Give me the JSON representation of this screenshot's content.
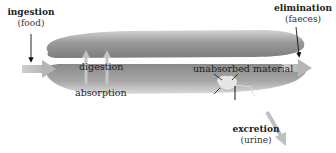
{
  "diagram": {
    "title": "",
    "labels": {
      "ingestion": {
        "title": "ingestion",
        "sub": "(food)"
      },
      "elimination": {
        "title": "elimination",
        "sub": "(faeces)"
      },
      "excretion": {
        "title": "excretion",
        "sub": "(urine)"
      },
      "digestion": "digestion",
      "absorption": "absorption",
      "unabsorbed": "unabsorbed material"
    },
    "colors": {
      "tube_dark": "#8a8a8a",
      "tube_light": "#c9c9c9",
      "arrow_gray": "#b9b9b9",
      "text": "#222222",
      "background": "#ffffff"
    }
  }
}
